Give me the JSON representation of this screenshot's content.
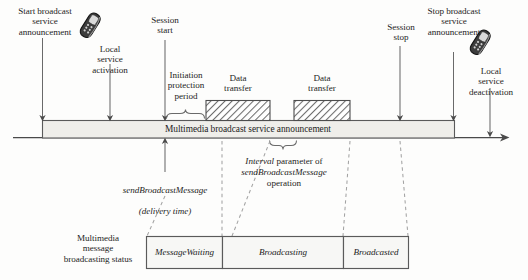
{
  "diagram": {
    "axis": {
      "arrow_end_label": "",
      "line_color": "#4a4a4a"
    },
    "timeline_bar": {
      "label": "Multimedia broadcast service announcement",
      "fill": "#efeeea",
      "stroke": "#5a5a5a"
    },
    "event_labels": [
      {
        "id": "start-broadcast",
        "text": "Start broadcast\nservice\nannouncement"
      },
      {
        "id": "local-service-activation",
        "text": "Local\nservice\nactivation"
      },
      {
        "id": "session-start",
        "text": "Session\nstart"
      },
      {
        "id": "initiation-protection-period",
        "text": "Initiation\nprotection\nperiod"
      },
      {
        "id": "session-stop",
        "text": "Session\nstop"
      },
      {
        "id": "stop-broadcast",
        "text": "Stop broadcast\nservice\nannouncement"
      },
      {
        "id": "local-service-deactivation",
        "text": "Local\nservice\ndeactivation"
      }
    ],
    "data_transfer_blocks": [
      {
        "id": "data-transfer-1",
        "label": "Data\ntransfer"
      },
      {
        "id": "data-transfer-2",
        "label": "Data\ntransfer"
      }
    ],
    "annotations": {
      "send_message": {
        "line1": "sendBroadcastMessage",
        "line2": "(delivery time)"
      },
      "interval_parameter": {
        "word_italic_1": "Interval",
        "word_roman_1": " parameter of",
        "word_italic_2": "sendBroadcastMessage",
        "word_roman_2": "operation"
      }
    },
    "status_track": {
      "label": "Multimedia\nmessage\nbroadcasting status",
      "states": [
        {
          "id": "message-waiting",
          "label": "MessageWaiting"
        },
        {
          "id": "broadcasting",
          "label": "Broadcasting"
        },
        {
          "id": "broadcasted",
          "label": "Broadcasted"
        }
      ]
    },
    "icons": [
      {
        "id": "mobile-phone-left",
        "name": "mobile-phone-icon"
      },
      {
        "id": "mobile-phone-right",
        "name": "mobile-phone-icon"
      }
    ],
    "colors": {
      "ink": "#1d1d1d",
      "rule": "#4a4a4a",
      "bar_fill": "#efeeea",
      "box_fill": "#f7f7f5",
      "hatch": "#6e6e6e",
      "dashed": "#9a9a9a"
    }
  }
}
